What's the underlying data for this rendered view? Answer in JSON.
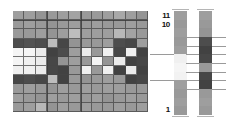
{
  "figure": {
    "title": "",
    "background_color": "#ffffff"
  },
  "chart_data": {
    "type": "heatmap",
    "title": "",
    "xlabel": "",
    "ylabel": "",
    "grid": true,
    "legend_position": "right",
    "colormap": "grayscale",
    "value_range": [
      0,
      1
    ],
    "rows": 11,
    "cols": 12,
    "row_labels": [
      "11",
      "10",
      "9",
      "8",
      "7",
      "6",
      "5",
      "4",
      "3",
      "2",
      "1"
    ],
    "col_labels": [
      "1",
      "2",
      "3",
      "4",
      "5",
      "6",
      "7",
      "8",
      "9",
      "10",
      "11",
      "12"
    ],
    "values": [
      [
        0.62,
        0.62,
        0.58,
        0.6,
        0.62,
        0.64,
        0.6,
        0.6,
        0.62,
        0.66,
        0.62,
        0.58
      ],
      [
        0.6,
        0.62,
        0.6,
        0.58,
        0.6,
        0.62,
        0.6,
        0.62,
        0.6,
        0.6,
        0.62,
        0.6
      ],
      [
        0.6,
        0.6,
        0.62,
        0.58,
        0.62,
        0.74,
        0.62,
        0.62,
        0.62,
        0.72,
        0.64,
        0.6
      ],
      [
        0.3,
        0.32,
        0.3,
        0.74,
        0.28,
        0.58,
        0.6,
        0.6,
        0.62,
        0.3,
        0.28,
        0.62
      ],
      [
        0.96,
        0.96,
        0.92,
        0.26,
        0.3,
        0.62,
        0.92,
        0.6,
        0.94,
        0.28,
        0.94,
        0.26
      ],
      [
        0.96,
        0.94,
        0.92,
        0.28,
        0.58,
        0.62,
        0.6,
        0.96,
        0.58,
        0.92,
        0.26,
        0.28
      ],
      [
        0.94,
        0.94,
        0.92,
        0.28,
        0.26,
        0.6,
        0.94,
        0.6,
        0.94,
        0.26,
        0.92,
        0.26
      ],
      [
        0.28,
        0.3,
        0.28,
        0.74,
        0.26,
        0.6,
        0.58,
        0.6,
        0.62,
        0.6,
        0.26,
        0.28
      ],
      [
        0.6,
        0.62,
        0.6,
        0.58,
        0.62,
        0.6,
        0.62,
        0.6,
        0.62,
        0.62,
        0.6,
        0.6
      ],
      [
        0.62,
        0.6,
        0.58,
        0.62,
        0.6,
        0.62,
        0.6,
        0.62,
        0.58,
        0.6,
        0.62,
        0.6
      ],
      [
        0.6,
        0.62,
        0.72,
        0.58,
        0.62,
        0.6,
        0.62,
        0.6,
        0.6,
        0.62,
        0.6,
        0.62
      ]
    ],
    "major_vertical_rules": [
      3,
      6
    ],
    "major_horizontal_rules": [
      1
    ],
    "colorbars": [
      {
        "name": "colorbar-a",
        "values": [
          0.62,
          0.6,
          0.62,
          0.6,
          0.62,
          0.94,
          0.96,
          0.95,
          0.62,
          0.6,
          0.62,
          0.6
        ],
        "ticks": [
          5,
          8
        ]
      },
      {
        "name": "colorbar-b",
        "values": [
          0.62,
          0.6,
          0.58,
          0.3,
          0.26,
          0.28,
          0.6,
          0.28,
          0.26,
          0.6,
          0.62,
          0.6
        ],
        "ticks": [
          3,
          4,
          5,
          6,
          7,
          8,
          9
        ]
      }
    ]
  },
  "axis": {
    "labels": [
      {
        "id": "label-11",
        "text": "11"
      },
      {
        "id": "label-10",
        "text": "10"
      },
      {
        "id": "label-1",
        "text": "1"
      }
    ],
    "top_label_1": "11",
    "top_label_2": "10",
    "bottom_label": "1",
    "color": "#111111"
  }
}
